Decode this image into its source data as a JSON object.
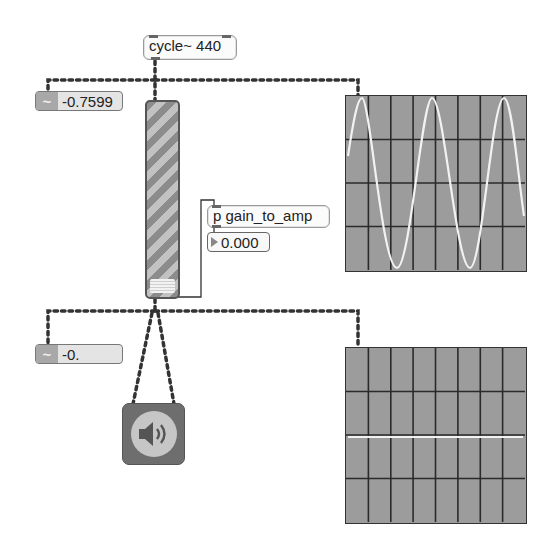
{
  "patch": {
    "cycle_object": {
      "label": "cycle~ 440"
    },
    "signal_number_top": {
      "icon": "tilde-icon",
      "value": "-0.7599"
    },
    "signal_number_bottom": {
      "icon": "tilde-icon",
      "value": "-0."
    },
    "gain_slider": {
      "type": "gain~"
    },
    "subpatch": {
      "label": "p gain_to_amp"
    },
    "number_box": {
      "value": "0.000"
    },
    "dac": {
      "icon": "speaker-icon"
    },
    "scope_top": {
      "grid_cols": 8,
      "grid_rows": 4,
      "signal": "sine",
      "cycles_visible": 2.75
    },
    "scope_bottom": {
      "grid_cols": 8,
      "grid_rows": 4,
      "signal": "flat"
    }
  },
  "colors": {
    "scope_bg": "#9c9c9c",
    "scope_grid": "#2a2a2a",
    "scope_trace": "#f2f2f2",
    "patch_cord": "#333333"
  }
}
